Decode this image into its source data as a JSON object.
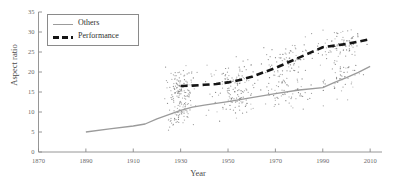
{
  "chart_data": {
    "type": "scatter",
    "title": "",
    "xlabel": "Year",
    "ylabel": "Aspect ratio",
    "xlim": [
      1870,
      2015
    ],
    "ylim": [
      0,
      35
    ],
    "xticks": [
      1870,
      1890,
      1910,
      1930,
      1950,
      1970,
      1990,
      2010
    ],
    "yticks": [
      0,
      5,
      10,
      15,
      20,
      25,
      30,
      35
    ],
    "xticklabels": [
      "1870",
      "1890",
      "1910",
      "1930",
      "1950",
      "1970",
      "1990",
      "2010"
    ],
    "yticklabels": [
      "0",
      "5",
      "10",
      "15",
      "20",
      "25",
      "30",
      "35"
    ],
    "grid": false,
    "legend_position": "upper left",
    "legend": [
      "Others",
      "Performance"
    ],
    "series": [
      {
        "name": "Others",
        "style": "solid",
        "color": "#9b9b9b",
        "x": [
          1890,
          1900,
          1910,
          1915,
          1920,
          1930,
          1935,
          1940,
          1950,
          1960,
          1970,
          1980,
          1990,
          1995,
          2000,
          2005,
          2010
        ],
        "values": [
          5.0,
          5.8,
          6.5,
          7.0,
          8.3,
          10.4,
          11.2,
          11.7,
          12.6,
          13.6,
          14.6,
          15.5,
          16.1,
          17.4,
          18.6,
          19.9,
          21.4
        ]
      },
      {
        "name": "Performance",
        "style": "dashed",
        "color": "#151515",
        "x": [
          1930,
          1935,
          1940,
          1945,
          1950,
          1955,
          1960,
          1965,
          1970,
          1975,
          1980,
          1985,
          1990,
          1995,
          2000,
          2005,
          2010
        ],
        "values": [
          16.5,
          16.6,
          16.8,
          17.0,
          17.4,
          18.0,
          18.8,
          19.9,
          21.0,
          22.3,
          23.6,
          24.9,
          26.2,
          26.6,
          27.0,
          27.6,
          28.2
        ]
      }
    ],
    "scatter": {
      "name": "observations",
      "color": "#6d6d6d",
      "marker": "dot",
      "point_count": 620,
      "x_range": [
        1921,
        2012
      ],
      "y_range": [
        1,
        34
      ],
      "density_peak_year": 1935,
      "density_peak_value": 17
    }
  },
  "figure": {
    "axis_color": "#8a8a8a",
    "background": "#ffffff"
  }
}
